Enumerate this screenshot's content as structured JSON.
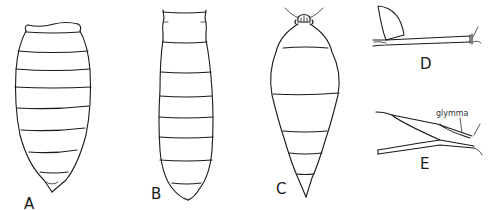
{
  "figure": {
    "panels": [
      {
        "id": "A",
        "label": "A",
        "description": "gaster dorsal view, oval, many segments"
      },
      {
        "id": "B",
        "label": "B",
        "description": "gaster dorsal view, elongate, many segments"
      },
      {
        "id": "C",
        "label": "C",
        "description": "gaster with petiole node, swollen segments"
      },
      {
        "id": "D",
        "label": "D",
        "description": "hind coxa and femur, lateral view"
      },
      {
        "id": "E",
        "label": "E",
        "description": "femur-tibia joint lateral view"
      }
    ],
    "annotations": [
      {
        "panel": "E",
        "text": "glymma"
      }
    ]
  },
  "colors": {
    "ink": "#1a1a1a",
    "background": "#ffffff"
  }
}
